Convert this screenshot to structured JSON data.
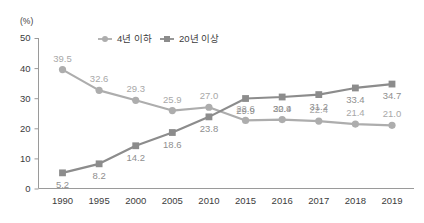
{
  "chart_data": {
    "type": "line",
    "title": "",
    "subtitle": "",
    "xlabel": "",
    "ylabel": "(%)",
    "unit_label": "(%)",
    "categories": [
      "1990",
      "1995",
      "2000",
      "2005",
      "2010",
      "2015",
      "2016",
      "2017",
      "2018",
      "2019"
    ],
    "ylim": [
      0,
      50
    ],
    "yticks": [
      0,
      10,
      20,
      30,
      40,
      50
    ],
    "ytick_labels": [
      "0",
      "10",
      "20",
      "30",
      "40",
      "50"
    ],
    "grid": false,
    "legend_position": "top-center",
    "series": [
      {
        "name": "4년 이하",
        "marker": "circle",
        "color": "#adadad",
        "label_position": "above",
        "values": [
          39.5,
          32.6,
          29.3,
          25.9,
          27.0,
          22.6,
          22.9,
          22.4,
          21.4,
          21.0
        ],
        "value_labels": [
          "39.5",
          "32.6",
          "29.3",
          "25.9",
          "27.0",
          "22.6",
          "22.9",
          "22.4",
          "21.4",
          "21.0"
        ]
      },
      {
        "name": "20년 이상",
        "marker": "square",
        "color": "#8c8c8c",
        "label_position": "below",
        "values": [
          5.2,
          8.2,
          14.2,
          18.6,
          23.8,
          29.9,
          30.4,
          31.2,
          33.4,
          34.7
        ],
        "value_labels": [
          "5.2",
          "8.2",
          "14.2",
          "18.6",
          "23.8",
          "29.9",
          "30.4",
          "31.2",
          "33.4",
          "34.7"
        ]
      }
    ]
  },
  "colors": {
    "series_light": "#adadad",
    "series_dark": "#8c8c8c",
    "axis": "#9a9a9a",
    "text": "#3c3c3c",
    "label_light": "#a8a8a8",
    "label_dark": "#8f8f8f",
    "background": "#ffffff"
  }
}
